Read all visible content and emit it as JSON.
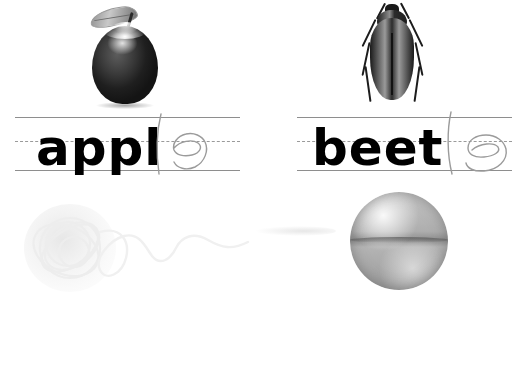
{
  "worksheet": {
    "title": "Handwriting practice worksheet",
    "background_color": "#ffffff",
    "rule_color": "#8e8e8e",
    "mid_rule_color": "#9a9a9a",
    "traced_letter_color": "#9b9b9b",
    "typed_letter_color": "#000000"
  },
  "panels": [
    {
      "id": "apple",
      "picture_name": "apple-photo",
      "picture_caption": "apple",
      "word": "apple",
      "typed_part": "appl",
      "traced_part": "e",
      "position": "top-left"
    },
    {
      "id": "beetle",
      "picture_name": "beetle-photo",
      "picture_caption": "beetle",
      "word": "beetle",
      "typed_part": "beet",
      "traced_part": "le",
      "position": "top-right"
    },
    {
      "id": "noodle",
      "picture_name": "noodle-photo",
      "picture_caption": "noodle",
      "word": "noodle",
      "typed_part": "nood",
      "traced_part": "le",
      "position": "bottom-left"
    },
    {
      "id": "bubble",
      "picture_name": "bubble-photo",
      "picture_caption": "bubble",
      "word": "bubb",
      "typed_part": "bubb",
      "traced_part": "",
      "position": "bottom-right"
    }
  ]
}
